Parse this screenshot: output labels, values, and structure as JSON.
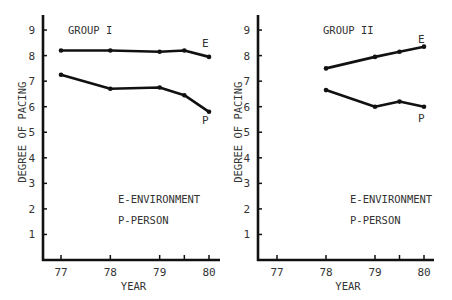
{
  "chart_data": [
    {
      "type": "line",
      "title": "GROUP I",
      "xlabel": "YEAR",
      "ylabel": "DEGREE OF PACING",
      "x_ticks": [
        "77",
        "78",
        "79",
        "80"
      ],
      "y_ticks": [
        "1",
        "2",
        "3",
        "4",
        "5",
        "6",
        "7",
        "8",
        "9"
      ],
      "ylim": [
        0,
        9.6
      ],
      "xlim": [
        76.7,
        80.2
      ],
      "grid": false,
      "series": [
        {
          "name": "E",
          "x": [
            77,
            78,
            79,
            79.5,
            80
          ],
          "values": [
            8.2,
            8.2,
            8.15,
            8.2,
            7.95
          ]
        },
        {
          "name": "P",
          "x": [
            77,
            78,
            79,
            79.5,
            80
          ],
          "values": [
            7.25,
            6.7,
            6.75,
            6.45,
            5.8
          ]
        }
      ],
      "annotations": [
        "E-ENVIRONMENT",
        "P-PERSON"
      ]
    },
    {
      "type": "line",
      "title": "GROUP II",
      "xlabel": "YEAR",
      "ylabel": "DEGREE OF PACING",
      "x_ticks": [
        "77",
        "78",
        "79",
        "80"
      ],
      "y_ticks": [
        "1",
        "2",
        "3",
        "4",
        "5",
        "6",
        "7",
        "8",
        "9"
      ],
      "ylim": [
        0,
        9.6
      ],
      "xlim": [
        76.7,
        80.2
      ],
      "grid": false,
      "series": [
        {
          "name": "E",
          "x": [
            78,
            79,
            79.5,
            80
          ],
          "values": [
            7.5,
            7.95,
            8.15,
            8.35
          ]
        },
        {
          "name": "P",
          "x": [
            78,
            79,
            79.5,
            80
          ],
          "values": [
            6.65,
            6.0,
            6.2,
            6.0
          ]
        }
      ],
      "annotations": [
        "E-ENVIRONMENT",
        "P-PERSON"
      ]
    }
  ],
  "panels": [
    {
      "title": "GROUP I",
      "xlabel": "YEAR",
      "ylabel": "DEGREE OF PACING",
      "legend_e": "E-ENVIRONMENT",
      "legend_p": "P-PERSON",
      "label_e": "E",
      "label_p": "P"
    },
    {
      "title": "GROUP II",
      "xlabel": "YEAR",
      "ylabel": "DEGREE OF PACING",
      "legend_e": "E-ENVIRONMENT",
      "legend_p": "P-PERSON",
      "label_e": "E",
      "label_p": "P"
    }
  ],
  "colors": {
    "line": "#111111",
    "text": "#333333",
    "axis": "#111111"
  }
}
